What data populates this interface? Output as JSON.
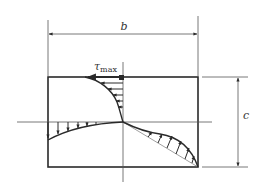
{
  "diagram": {
    "labels": {
      "width": "b",
      "height": "c",
      "tau": "τ",
      "tau_sub": "max"
    },
    "colors": {
      "line": "#2a2a2a",
      "thin": "#555555",
      "background": "#ffffff"
    }
  }
}
